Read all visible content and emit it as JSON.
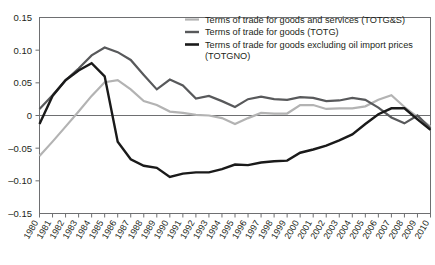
{
  "chart_data": {
    "type": "line",
    "title": "",
    "subtitle": "",
    "xlabel": "",
    "ylabel": "",
    "xlim": [
      1980,
      2010
    ],
    "ylim": [
      -0.15,
      0.15
    ],
    "grid": false,
    "zero_line": true,
    "legend_position": "top-right",
    "x": [
      1980,
      1981,
      1982,
      1983,
      1984,
      1985,
      1986,
      1987,
      1988,
      1989,
      1990,
      1991,
      1992,
      1993,
      1994,
      1995,
      1996,
      1997,
      1998,
      1999,
      2000,
      2001,
      2002,
      2003,
      2004,
      2005,
      2006,
      2007,
      2008,
      2009,
      2010
    ],
    "tick_labels": [
      "1980",
      "1981",
      "1982",
      "1983",
      "1984",
      "1985",
      "1986",
      "1987",
      "1988",
      "1989",
      "1990",
      "1991",
      "1992",
      "1993",
      "1994",
      "1995",
      "1996",
      "1997",
      "1998",
      "1999",
      "2000",
      "2001",
      "2002",
      "2003",
      "2004",
      "2005",
      "2006",
      "2007",
      "2008",
      "2009",
      "2010"
    ],
    "ytick_labels": [
      "0.15",
      "0.10",
      "0.05",
      "0",
      "-0.05",
      "-0.10",
      "-0.15"
    ],
    "ytick_values": [
      0.15,
      0.1,
      0.05,
      0,
      -0.05,
      -0.1,
      -0.15
    ],
    "series": [
      {
        "name": "Terms of trade for goods and services (TOTG&S)",
        "code": "TOTG&S",
        "color": "#b3b3b3",
        "width": 2.2,
        "values": [
          -0.062,
          -0.04,
          -0.017,
          0.006,
          0.03,
          0.051,
          0.054,
          0.04,
          0.022,
          0.016,
          0.006,
          0.004,
          0.001,
          0.0,
          -0.004,
          -0.013,
          -0.004,
          0.004,
          0.003,
          0.003,
          0.016,
          0.016,
          0.01,
          0.011,
          0.011,
          0.014,
          0.024,
          0.031,
          0.013,
          -0.002,
          -0.017
        ]
      },
      {
        "name": "Terms of trade for goods (TOTG)",
        "code": "TOTG",
        "color": "#58595b",
        "width": 2.2,
        "values": [
          0.01,
          0.031,
          0.054,
          0.072,
          0.092,
          0.104,
          0.097,
          0.085,
          0.062,
          0.04,
          0.055,
          0.046,
          0.026,
          0.03,
          0.022,
          0.013,
          0.025,
          0.029,
          0.025,
          0.024,
          0.028,
          0.027,
          0.022,
          0.023,
          0.027,
          0.024,
          0.012,
          -0.003,
          -0.012,
          0.0,
          -0.02
        ]
      },
      {
        "name": "Terms of trade for goods excluding oil import prices (TOTGNO)",
        "code": "TOTGNO",
        "color": "#1a1a1a",
        "width": 2.4,
        "values": [
          -0.013,
          0.03,
          0.054,
          0.069,
          0.08,
          0.06,
          -0.04,
          -0.067,
          -0.077,
          -0.08,
          -0.094,
          -0.089,
          -0.087,
          -0.087,
          -0.082,
          -0.075,
          -0.076,
          -0.072,
          -0.07,
          -0.069,
          -0.057,
          -0.052,
          -0.046,
          -0.038,
          -0.029,
          -0.013,
          0.002,
          0.011,
          0.011,
          -0.006,
          -0.022
        ]
      }
    ],
    "legend_entries": [
      {
        "label": "Terms of trade for goods and services (TOTG&S)",
        "color": "#b3b3b3"
      },
      {
        "label": "Terms of trade for goods (TOTG)",
        "color": "#58595b"
      },
      {
        "label": "Terms of trade for goods excluding oil import prices",
        "label2": "(TOTGNO)",
        "color": "#1a1a1a"
      }
    ]
  },
  "colors": {
    "axis": "#6e6f71",
    "text": "#231f20",
    "background": "#ffffff"
  }
}
